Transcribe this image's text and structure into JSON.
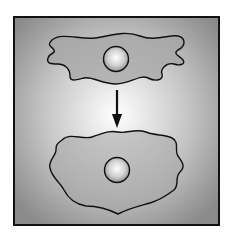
{
  "diagram": {
    "colors": {
      "background_center": "#ffffff",
      "background_edge": "#8c8c8c",
      "cell_fill": "#a8a8a8",
      "outline": "#111111",
      "nucleus_center": "#ffffff",
      "nucleus_edge": "#9a9a9a"
    },
    "elements": [
      {
        "name": "elongated-cell",
        "label": ""
      },
      {
        "name": "down-arrow",
        "label": ""
      },
      {
        "name": "spread-cell",
        "label": ""
      }
    ]
  }
}
